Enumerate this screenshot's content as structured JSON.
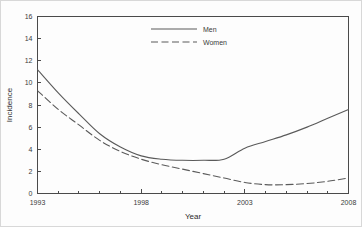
{
  "chart_data": {
    "type": "line",
    "title": "",
    "xlabel": "Year",
    "ylabel": "Incidence",
    "xlim": [
      1993,
      2008
    ],
    "ylim": [
      0,
      16
    ],
    "grid": false,
    "legend_position": "top-center",
    "x": [
      1993,
      1994,
      1995,
      1996,
      1997,
      1998,
      1999,
      2000,
      2001,
      2002,
      2003,
      2004,
      2005,
      2006,
      2007,
      2008
    ],
    "xticks": [
      1993,
      1994,
      1995,
      1996,
      1997,
      1998,
      1999,
      2000,
      2001,
      2002,
      2003,
      2004,
      2005,
      2006,
      2007,
      2008
    ],
    "xtick_labels": [
      "1993",
      "",
      "",
      "",
      "",
      "1998",
      "",
      "",
      "",
      "",
      "2003",
      "",
      "",
      "",
      "",
      "2008"
    ],
    "xtick_labels_shown": [
      "1993",
      "1998",
      "2003",
      "2008"
    ],
    "yticks": [
      0,
      2,
      4,
      6,
      8,
      10,
      12,
      14,
      16
    ],
    "ytick_labels": [
      "0",
      "2",
      "4",
      "6",
      "8",
      "10",
      "12",
      "14",
      "16"
    ],
    "series": [
      {
        "name": "Men",
        "style": "solid",
        "color": "#5a5a5a",
        "values": [
          11.2,
          9.1,
          7.2,
          5.4,
          4.2,
          3.4,
          3.1,
          3.0,
          3.0,
          3.1,
          4.1,
          4.7,
          5.3,
          6.0,
          6.8,
          7.6
        ]
      },
      {
        "name": "Women",
        "style": "dashed",
        "color": "#5a5a5a",
        "values": [
          9.3,
          7.6,
          6.2,
          4.8,
          3.8,
          3.1,
          2.6,
          2.2,
          1.8,
          1.4,
          1.0,
          0.8,
          0.8,
          0.9,
          1.1,
          1.4
        ]
      }
    ]
  },
  "legend": {
    "entries": [
      {
        "label": "Men"
      },
      {
        "label": "Women"
      }
    ]
  },
  "axes": {
    "x_title": "Year",
    "y_title": "Incidence"
  }
}
